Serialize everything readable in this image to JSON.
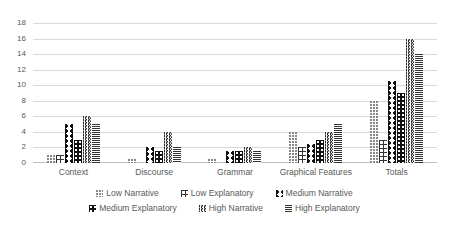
{
  "chart_data": {
    "type": "bar",
    "title": "",
    "xlabel": "",
    "ylabel": "",
    "ylim": [
      0,
      18
    ],
    "ytick_step": 2,
    "yticks": [
      18,
      16,
      14,
      12,
      10,
      8,
      6,
      4,
      2,
      0
    ],
    "grid": true,
    "legend_position": "bottom",
    "categories": [
      "Context",
      "Discourse",
      "Grammar",
      "Graphical Features",
      "Totals"
    ],
    "series": [
      {
        "name": "Low Narrative",
        "pattern": "sparse-dots",
        "color": "#7f7f7f",
        "values": [
          1,
          0.5,
          0.5,
          4,
          8
        ]
      },
      {
        "name": "Low Explanatory",
        "pattern": "grid-crosshatch",
        "color": "#333333",
        "values": [
          1,
          0,
          0,
          2,
          3
        ]
      },
      {
        "name": "Medium Narrative",
        "pattern": "bowtie-diamond",
        "color": "#111111",
        "values": [
          5,
          2,
          1.5,
          2.5,
          10.5
        ]
      },
      {
        "name": "Medium Explanatory",
        "pattern": "solid-dark-dotted",
        "color": "#111111",
        "values": [
          3,
          1.5,
          1.5,
          3,
          9
        ]
      },
      {
        "name": "High Narrative",
        "pattern": "wavy-zigzag",
        "color": "#2b2b2b",
        "values": [
          6,
          4,
          2,
          4,
          16
        ]
      },
      {
        "name": "High Explanatory",
        "pattern": "horizontal-lines",
        "color": "#333333",
        "values": [
          5,
          2,
          1.5,
          5,
          14
        ]
      }
    ]
  },
  "colors": {
    "gridline": "#d9d9d9",
    "axis_text": "#595959",
    "background": "#ffffff"
  }
}
